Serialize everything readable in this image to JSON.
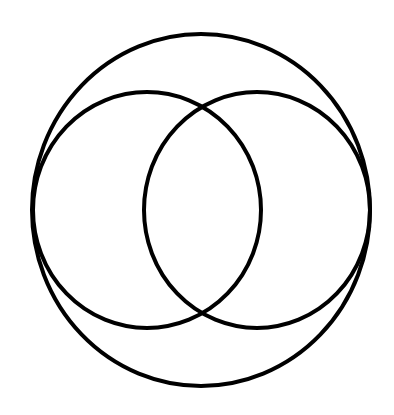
{
  "diagram": {
    "type": "circles",
    "background": "#ffffff",
    "stroke_color": "#000000",
    "stroke_width": 4,
    "shapes": [
      {
        "id": "outer-circle",
        "cx": 201,
        "cy": 210,
        "rx": 169,
        "ry": 176
      },
      {
        "id": "left-inner-circle",
        "cx": 147,
        "cy": 210,
        "rx": 114,
        "ry": 118
      },
      {
        "id": "right-inner-circle",
        "cx": 257,
        "cy": 210,
        "rx": 113,
        "ry": 118
      }
    ]
  }
}
